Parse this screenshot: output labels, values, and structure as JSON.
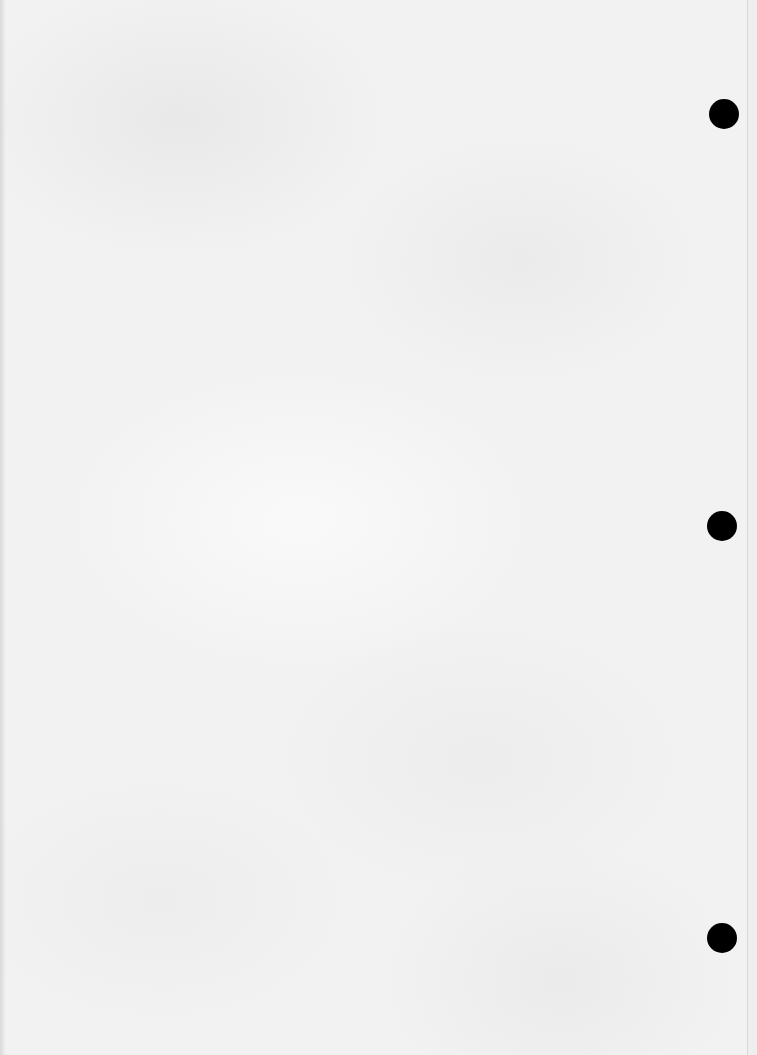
{
  "page": {
    "type": "blank scanned sheet",
    "background_color": "#f2f2f2",
    "text_content": ""
  },
  "punch_holes": [
    {
      "id": "top",
      "cx": 724,
      "cy": 114,
      "diameter": 30,
      "color": "#000000"
    },
    {
      "id": "middle",
      "cx": 722,
      "cy": 526,
      "diameter": 30,
      "color": "#000000"
    },
    {
      "id": "bottom",
      "cx": 722,
      "cy": 938,
      "diameter": 30,
      "color": "#000000"
    }
  ]
}
